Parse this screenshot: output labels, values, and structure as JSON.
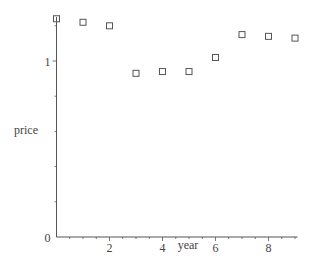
{
  "chart_data": {
    "type": "scatter",
    "title": "",
    "xlabel": "year",
    "ylabel": "price",
    "x": [
      0,
      1,
      2,
      3,
      4,
      5,
      6,
      7,
      8,
      9
    ],
    "series": [
      {
        "name": "price",
        "marker": "open-square",
        "values": [
          1.24,
          1.22,
          1.2,
          0.93,
          0.94,
          0.94,
          1.02,
          1.15,
          1.14,
          1.13
        ]
      }
    ],
    "xlim": [
      0,
      9.1
    ],
    "ylim": [
      0,
      1.25
    ],
    "x_ticks": [
      {
        "value": 2,
        "label": "2"
      },
      {
        "value": 4,
        "label": "4"
      },
      {
        "value": 6,
        "label": "6"
      },
      {
        "value": 8,
        "label": "8"
      }
    ],
    "y_ticks": [
      {
        "value": 0,
        "label": "0"
      },
      {
        "value": 1,
        "label": "1"
      }
    ],
    "x_minor_step": 0.5,
    "y_minor_step": 0.2,
    "grid": false,
    "legend": null,
    "colors": {
      "axis": "#555555",
      "marker": "#555555",
      "text": "#444444"
    }
  }
}
